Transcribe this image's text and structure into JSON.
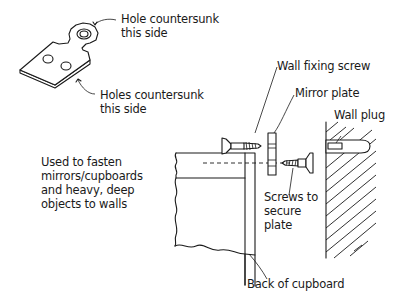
{
  "diagram": {
    "labels": {
      "hole_countersunk": "Hole countersunk\nthis side",
      "holes_countersunk": "Holes countersunk\nthis side",
      "usage_note": "Used to fasten\nmirrors/cupboards\nand heavy, deep\nobjects to walls",
      "wall_fixing_screw": "Wall fixing screw",
      "mirror_plate": "Mirror plate",
      "wall_plug": "Wall plug",
      "screws_to_secure": "Screws to\nsecure\nplate",
      "back_of_cupboard": "Back of cupboard"
    },
    "components": [
      {
        "name": "mirror-plate-perspective",
        "description": "Mirror plate with one top hole and two bottom holes"
      },
      {
        "name": "wall-fixing-screw",
        "description": "Countersunk screw into wall"
      },
      {
        "name": "mirror-plate-side",
        "description": "Mirror plate in side view"
      },
      {
        "name": "plate-securing-screw",
        "description": "Screw securing plate to cupboard"
      },
      {
        "name": "wall-plug",
        "description": "Plug inserted in wall"
      },
      {
        "name": "wall",
        "description": "Hatched wall section"
      },
      {
        "name": "cupboard",
        "description": "Cupboard section with back panel"
      }
    ]
  }
}
